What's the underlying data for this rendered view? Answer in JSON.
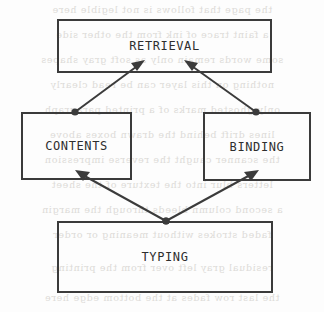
{
  "diagram": {
    "type": "node-link-diagram",
    "canvas": {
      "width": 324,
      "height": 312
    },
    "style": {
      "background_color": "#fdfdfd",
      "stroke_color": "#3b3b3b",
      "text_color": "#2e2e2e",
      "ghost_text_color": "#d8d6d2"
    },
    "nodes": [
      {
        "id": "retrieval",
        "label": "RETRIEVAL",
        "shape": "rectangle",
        "x": 57,
        "y": 19,
        "width": 215,
        "height": 54
      },
      {
        "id": "contents",
        "label": "CONTENTS",
        "shape": "rectangle",
        "x": 21,
        "y": 112,
        "width": 111,
        "height": 68
      },
      {
        "id": "binding",
        "label": "BINDING",
        "shape": "rectangle",
        "x": 203,
        "y": 112,
        "width": 108,
        "height": 69
      },
      {
        "id": "typing",
        "label": "TYPING",
        "shape": "rectangle",
        "x": 57,
        "y": 221,
        "width": 216,
        "height": 72
      }
    ],
    "edges": [
      {
        "id": "contents-to-retrieval",
        "from": "contents",
        "to": "retrieval",
        "from_point": {
          "x": 75,
          "y": 112
        },
        "to_point": {
          "x": 143,
          "y": 62
        },
        "source_marker": "dot",
        "target_marker": "arrowhead"
      },
      {
        "id": "binding-to-retrieval",
        "from": "binding",
        "to": "retrieval",
        "from_point": {
          "x": 256,
          "y": 112
        },
        "to_point": {
          "x": 186,
          "y": 62
        },
        "source_marker": "dot",
        "target_marker": "arrowhead"
      },
      {
        "id": "typing-to-contents",
        "from": "typing",
        "to": "contents",
        "from_point": {
          "x": 166,
          "y": 221
        },
        "to_point": {
          "x": 77,
          "y": 171
        },
        "source_marker": "dot",
        "target_marker": "arrowhead"
      },
      {
        "id": "typing-to-binding",
        "from": "typing",
        "to": "binding",
        "from_point": {
          "x": 166,
          "y": 221
        },
        "to_point": {
          "x": 257,
          "y": 171
        },
        "source_marker": "dot",
        "target_marker": "arrowhead"
      }
    ]
  },
  "background_bleed": {
    "description": "faint mirrored show-through text from reverse page of scan",
    "lines": [
      "the page that follows is not legible here",
      "a faint trace of ink from the other side",
      "some words remain only as soft gray shapes",
      "nothing on this layer can be read clearly",
      "only ghosted marks of a printed paragraph",
      "lines drift behind the drawn boxes above",
      "the scanner caught the reverse impression",
      "letters blur into the texture of the sheet",
      "a second column bleeds through the margin",
      "faded strokes without meaning or order",
      "residual gray left over from the printing",
      "the last row fades at the bottom edge here"
    ]
  }
}
